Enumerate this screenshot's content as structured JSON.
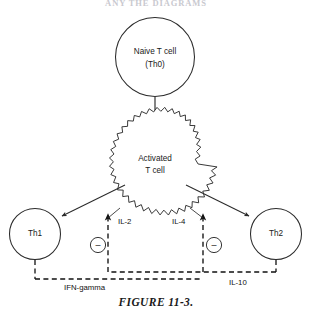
{
  "figure": {
    "cut_off_header": "ANY THE DIAGRAMS",
    "caption": "FIGURE 11-3.",
    "nodes": {
      "naive": {
        "line1": "Naive T cell",
        "line2": "(Th0)"
      },
      "activated": {
        "line1": "Activated",
        "line2": "T cell"
      },
      "th1": {
        "label": "Th1"
      },
      "th2": {
        "label": "Th2"
      }
    },
    "cytokines": {
      "il2": "IL-2",
      "il4": "IL-4",
      "ifn_gamma": "IFN-gamma",
      "il10": "IL-10"
    },
    "inhibition": {
      "left_sign": "–",
      "right_sign": "–"
    },
    "colors": {
      "stroke": "#2b2b2b",
      "text": "#1a1a1a",
      "background": "#ffffff",
      "header_faded": "#c9c9cf"
    }
  }
}
